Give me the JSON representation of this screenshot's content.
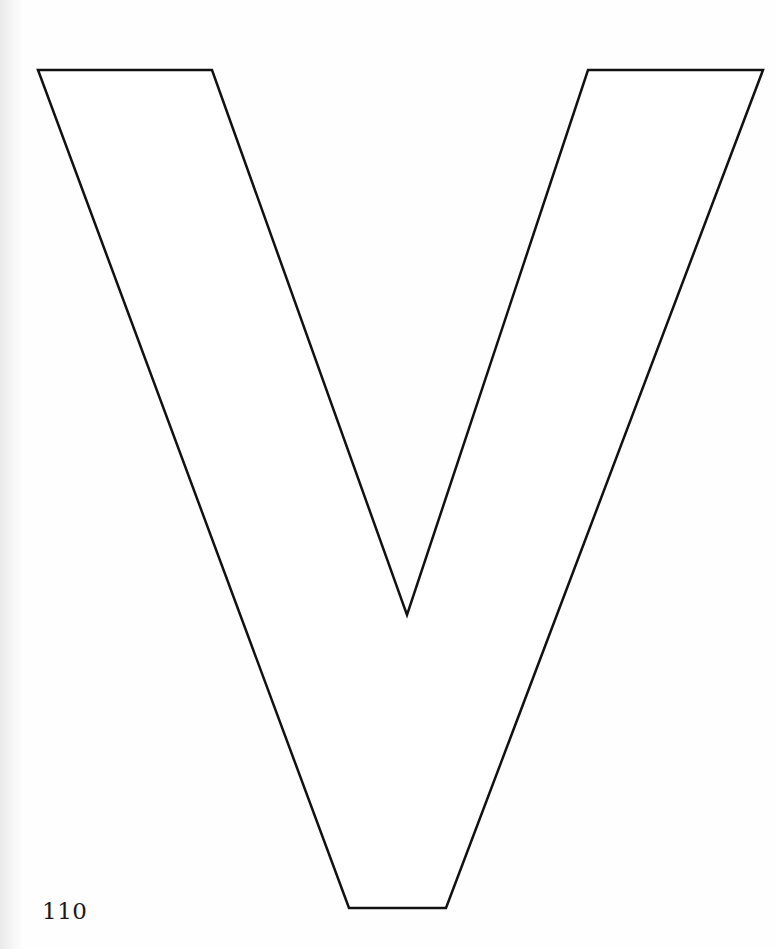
{
  "page": {
    "type": "coloring-book page",
    "letter": "V",
    "page_number": "110",
    "outline_color": "#111111",
    "fill_color": "#ffffff",
    "background_color": "#fefefe"
  },
  "shape": {
    "points": "38,70 212,70 407,615 588,70 763,70 446,908 349,908",
    "stroke_width": 2.5
  }
}
